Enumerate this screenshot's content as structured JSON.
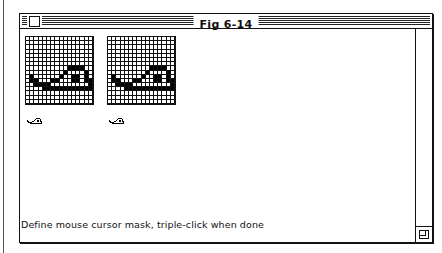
{
  "window": {
    "title": "Fig 6-14"
  },
  "editors": [
    {
      "name": "cursor-data",
      "grid_size": 16
    },
    {
      "name": "cursor-mask",
      "grid_size": 16
    }
  ],
  "bitmap": {
    "rows": [
      "0000000000000000",
      "0000000000000000",
      "0000000000000000",
      "0000000000000000",
      "0000000000000000",
      "0000000000000000",
      "0000000000000000",
      "0000000000111100",
      "0000000001000010",
      "0100000010011010",
      "0110001100011011",
      "0011110000000001",
      "0000111111111111",
      "0000000000000000",
      "0000000000000000",
      "0000000000000000"
    ]
  },
  "status": {
    "message": "Define mouse cursor mask, triple-click when done"
  },
  "icons": {
    "close": "close-box-icon",
    "grow": "size-box-icon",
    "preview": "snail-cursor-icon"
  },
  "colors": {
    "ink": "#111111",
    "paper": "#ffffff"
  }
}
